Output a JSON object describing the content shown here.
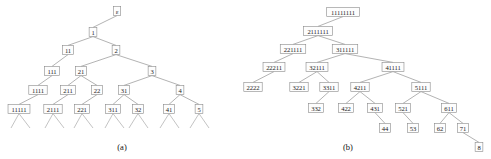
{
  "figure": {
    "panels": [
      {
        "id": "panel-a",
        "caption": "(a)",
        "caption_x": 122,
        "caption_y": 150,
        "tree": {
          "type": "tree",
          "description": "Tree of integer compositions / words over positive integers, root labelled epsilon",
          "nodes": [
            {
              "id": "a0",
              "label": "ε",
              "x": 117,
              "y": 11
            },
            {
              "id": "a1",
              "label": "1",
              "x": 93,
              "y": 32
            },
            {
              "id": "a2",
              "label": "11",
              "x": 68,
              "y": 50
            },
            {
              "id": "a3",
              "label": "2",
              "x": 116,
              "y": 50
            },
            {
              "id": "a4",
              "label": "111",
              "x": 52,
              "y": 71
            },
            {
              "id": "a5",
              "label": "21",
              "x": 81,
              "y": 71
            },
            {
              "id": "a6",
              "label": "3",
              "x": 152,
              "y": 71
            },
            {
              "id": "a7",
              "label": "1111",
              "x": 38,
              "y": 90
            },
            {
              "id": "a8",
              "label": "211",
              "x": 68,
              "y": 90
            },
            {
              "id": "a9",
              "label": "22",
              "x": 97,
              "y": 90
            },
            {
              "id": "a10",
              "label": "31",
              "x": 124,
              "y": 90
            },
            {
              "id": "a11",
              "label": "4",
              "x": 180,
              "y": 90
            },
            {
              "id": "a12",
              "label": "11111",
              "x": 19,
              "y": 109
            },
            {
              "id": "a13",
              "label": "2111",
              "x": 53,
              "y": 109
            },
            {
              "id": "a14",
              "label": "221",
              "x": 82,
              "y": 109
            },
            {
              "id": "a15",
              "label": "311",
              "x": 113,
              "y": 109
            },
            {
              "id": "a16",
              "label": "32",
              "x": 138,
              "y": 109
            },
            {
              "id": "a17",
              "label": "41",
              "x": 169,
              "y": 109
            },
            {
              "id": "a18",
              "label": "5",
              "x": 199,
              "y": 109
            }
          ],
          "edges": [
            [
              "a0",
              "a1"
            ],
            [
              "a1",
              "a2"
            ],
            [
              "a1",
              "a3"
            ],
            [
              "a2",
              "a4"
            ],
            [
              "a3",
              "a5"
            ],
            [
              "a3",
              "a6"
            ],
            [
              "a4",
              "a7"
            ],
            [
              "a5",
              "a8"
            ],
            [
              "a5",
              "a9"
            ],
            [
              "a6",
              "a10"
            ],
            [
              "a6",
              "a11"
            ],
            [
              "a7",
              "a12"
            ],
            [
              "a8",
              "a13"
            ],
            [
              "a9",
              "a14"
            ],
            [
              "a10",
              "a15"
            ],
            [
              "a10",
              "a16"
            ],
            [
              "a11",
              "a17"
            ],
            [
              "a11",
              "a18"
            ]
          ],
          "leaf_stubs": [
            {
              "from": "a12",
              "ends": [
                [
                  11,
                  128
                ],
                [
                  30,
                  128
                ]
              ]
            },
            {
              "from": "a13",
              "ends": [
                [
                  45,
                  128
                ],
                [
                  64,
                  128
                ]
              ]
            },
            {
              "from": "a14",
              "ends": [
                [
                  74,
                  128
                ],
                [
                  93,
                  128
                ]
              ]
            },
            {
              "from": "a15",
              "ends": [
                [
                  105,
                  128
                ],
                [
                  124,
                  128
                ]
              ]
            },
            {
              "from": "a16",
              "ends": [
                [
                  129,
                  128
                ],
                [
                  148,
                  128
                ]
              ]
            },
            {
              "from": "a17",
              "ends": [
                [
                  160,
                  128
                ],
                [
                  179,
                  128
                ]
              ]
            },
            {
              "from": "a18",
              "ends": [
                [
                  190,
                  128
                ],
                [
                  209,
                  128
                ]
              ]
            }
          ]
        }
      },
      {
        "id": "panel-b",
        "caption": "(b)",
        "caption_x": 348,
        "caption_y": 150,
        "tree": {
          "type": "tree",
          "description": "Tree of partitions of 8 in non-increasing part order",
          "nodes": [
            {
              "id": "b0",
              "label": "11111111",
              "x": 343,
              "y": 12
            },
            {
              "id": "b1",
              "label": "2111111",
              "x": 318,
              "y": 31
            },
            {
              "id": "b2",
              "label": "221111",
              "x": 293,
              "y": 49
            },
            {
              "id": "b3",
              "label": "311111",
              "x": 345,
              "y": 49
            },
            {
              "id": "b4",
              "label": "22211",
              "x": 274,
              "y": 67
            },
            {
              "id": "b5",
              "label": "32111",
              "x": 317,
              "y": 67
            },
            {
              "id": "b6",
              "label": "41111",
              "x": 393,
              "y": 67
            },
            {
              "id": "b7",
              "label": "2222",
              "x": 253,
              "y": 87
            },
            {
              "id": "b8",
              "label": "3221",
              "x": 299,
              "y": 87
            },
            {
              "id": "b9",
              "label": "3311",
              "x": 329,
              "y": 87
            },
            {
              "id": "b10",
              "label": "4211",
              "x": 360,
              "y": 87
            },
            {
              "id": "b11",
              "label": "5111",
              "x": 421,
              "y": 87
            },
            {
              "id": "b12",
              "label": "332",
              "x": 316,
              "y": 108
            },
            {
              "id": "b13",
              "label": "422",
              "x": 346,
              "y": 108
            },
            {
              "id": "b14",
              "label": "431",
              "x": 375,
              "y": 108
            },
            {
              "id": "b15",
              "label": "521",
              "x": 403,
              "y": 108
            },
            {
              "id": "b16",
              "label": "611",
              "x": 449,
              "y": 108
            },
            {
              "id": "b17",
              "label": "44",
              "x": 385,
              "y": 128
            },
            {
              "id": "b18",
              "label": "53",
              "x": 413,
              "y": 128
            },
            {
              "id": "b19",
              "label": "62",
              "x": 440,
              "y": 128
            },
            {
              "id": "b20",
              "label": "71",
              "x": 463,
              "y": 128
            },
            {
              "id": "b21",
              "label": "8",
              "x": 479,
              "y": 147
            }
          ],
          "edges": [
            [
              "b0",
              "b1"
            ],
            [
              "b1",
              "b2"
            ],
            [
              "b1",
              "b3"
            ],
            [
              "b2",
              "b4"
            ],
            [
              "b3",
              "b5"
            ],
            [
              "b3",
              "b6"
            ],
            [
              "b4",
              "b7"
            ],
            [
              "b5",
              "b8"
            ],
            [
              "b5",
              "b9"
            ],
            [
              "b6",
              "b10"
            ],
            [
              "b6",
              "b11"
            ],
            [
              "b9",
              "b12"
            ],
            [
              "b10",
              "b13"
            ],
            [
              "b10",
              "b14"
            ],
            [
              "b11",
              "b15"
            ],
            [
              "b11",
              "b16"
            ],
            [
              "b14",
              "b17"
            ],
            [
              "b15",
              "b18"
            ],
            [
              "b16",
              "b19"
            ],
            [
              "b16",
              "b20"
            ],
            [
              "b20",
              "b21"
            ]
          ],
          "leaf_stubs": []
        }
      }
    ]
  }
}
